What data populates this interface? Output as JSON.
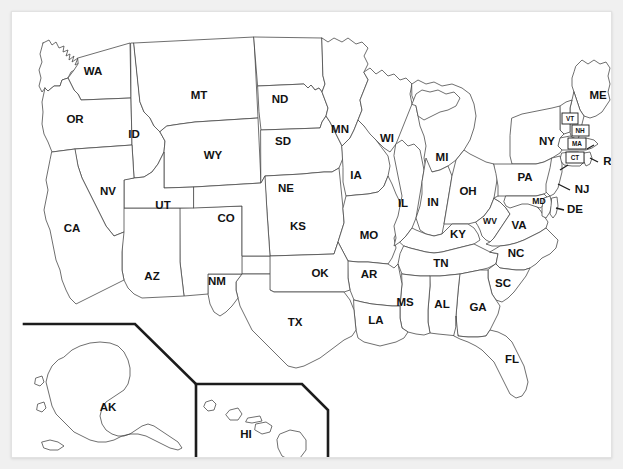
{
  "page": {
    "background_color": "#f0f0f0",
    "card_color": "#ffffff",
    "outline_color": "#4a4a4a",
    "label_color": "#121212",
    "inset_border_color": "#1c1c1c"
  },
  "map": {
    "type": "choropleth-outline",
    "region": "United States of America",
    "projection": "albers-usa",
    "state_count": 50,
    "labels_are_postal_abbreviations": true,
    "insets": [
      {
        "id": "alaska-inset",
        "label": "AK",
        "name": "Alaska"
      },
      {
        "id": "hawaii-inset",
        "label": "HI",
        "name": "Hawaii"
      }
    ]
  },
  "states": [
    {
      "abbr": "WA",
      "name": "Washington",
      "x": 81,
      "y": 60,
      "size": "lg"
    },
    {
      "abbr": "OR",
      "name": "Oregon",
      "x": 63,
      "y": 108,
      "size": "lg"
    },
    {
      "abbr": "ID",
      "name": "Idaho",
      "x": 122,
      "y": 123,
      "size": "lg"
    },
    {
      "abbr": "MT",
      "name": "Montana",
      "x": 187,
      "y": 84,
      "size": "lg"
    },
    {
      "abbr": "ND",
      "name": "North Dakota",
      "x": 268,
      "y": 88,
      "size": "lg"
    },
    {
      "abbr": "SD",
      "name": "South Dakota",
      "x": 271,
      "y": 130,
      "size": "lg"
    },
    {
      "abbr": "NE",
      "name": "Nebraska",
      "x": 274,
      "y": 177,
      "size": "lg"
    },
    {
      "abbr": "KS",
      "name": "Kansas",
      "x": 286,
      "y": 215,
      "size": "lg"
    },
    {
      "abbr": "MN",
      "name": "Minnesota",
      "x": 328,
      "y": 118,
      "size": "lg"
    },
    {
      "abbr": "IA",
      "name": "Iowa",
      "x": 344,
      "y": 164,
      "size": "lg"
    },
    {
      "abbr": "MO",
      "name": "Missouri",
      "x": 357,
      "y": 224,
      "size": "lg"
    },
    {
      "abbr": "WI",
      "name": "Wisconsin",
      "x": 375,
      "y": 127,
      "size": "lg"
    },
    {
      "abbr": "IL",
      "name": "Illinois",
      "x": 391,
      "y": 192,
      "size": "lg"
    },
    {
      "abbr": "MI",
      "name": "Michigan",
      "x": 430,
      "y": 146,
      "size": "lg"
    },
    {
      "abbr": "IN",
      "name": "Indiana",
      "x": 421,
      "y": 191,
      "size": "lg"
    },
    {
      "abbr": "OH",
      "name": "Ohio",
      "x": 456,
      "y": 180,
      "size": "lg"
    },
    {
      "abbr": "KY",
      "name": "Kentucky",
      "x": 446,
      "y": 223,
      "size": "lg"
    },
    {
      "abbr": "WV",
      "name": "West Virginia",
      "x": 478,
      "y": 210,
      "size": "md"
    },
    {
      "abbr": "VA",
      "name": "Virginia",
      "x": 507,
      "y": 214,
      "size": "lg"
    },
    {
      "abbr": "TN",
      "name": "Tennessee",
      "x": 429,
      "y": 252,
      "size": "lg"
    },
    {
      "abbr": "NC",
      "name": "North Carolina",
      "x": 504,
      "y": 242,
      "size": "lg"
    },
    {
      "abbr": "SC",
      "name": "South Carolina",
      "x": 491,
      "y": 272,
      "size": "lg"
    },
    {
      "abbr": "GA",
      "name": "Georgia",
      "x": 466,
      "y": 296,
      "size": "lg"
    },
    {
      "abbr": "AL",
      "name": "Alabama",
      "x": 430,
      "y": 293,
      "size": "lg"
    },
    {
      "abbr": "MS",
      "name": "Mississippi",
      "x": 393,
      "y": 291,
      "size": "lg"
    },
    {
      "abbr": "AR",
      "name": "Arkansas",
      "x": 357,
      "y": 263,
      "size": "lg"
    },
    {
      "abbr": "LA",
      "name": "Louisiana",
      "x": 364,
      "y": 309,
      "size": "lg"
    },
    {
      "abbr": "OK",
      "name": "Oklahoma",
      "x": 308,
      "y": 262,
      "size": "lg"
    },
    {
      "abbr": "TX",
      "name": "Texas",
      "x": 283,
      "y": 311,
      "size": "lg"
    },
    {
      "abbr": "NM",
      "name": "New Mexico",
      "x": 205,
      "y": 270,
      "size": "lg"
    },
    {
      "abbr": "AZ",
      "name": "Arizona",
      "x": 140,
      "y": 265,
      "size": "lg"
    },
    {
      "abbr": "UT",
      "name": "Utah",
      "x": 151,
      "y": 194,
      "size": "lg"
    },
    {
      "abbr": "CO",
      "name": "Colorado",
      "x": 214,
      "y": 207,
      "size": "lg"
    },
    {
      "abbr": "WY",
      "name": "Wyoming",
      "x": 201,
      "y": 144,
      "size": "lg"
    },
    {
      "abbr": "NV",
      "name": "Nevada",
      "x": 96,
      "y": 180,
      "size": "lg"
    },
    {
      "abbr": "CA",
      "name": "California",
      "x": 60,
      "y": 217,
      "size": "lg"
    },
    {
      "abbr": "FL",
      "name": "Florida",
      "x": 500,
      "y": 348,
      "size": "lg"
    },
    {
      "abbr": "ME",
      "name": "Maine",
      "x": 586,
      "y": 84,
      "size": "lg"
    },
    {
      "abbr": "NY",
      "name": "New York",
      "x": 535,
      "y": 130,
      "size": "lg"
    },
    {
      "abbr": "PA",
      "name": "Pennsylvania",
      "x": 513,
      "y": 166,
      "size": "lg"
    },
    {
      "abbr": "VT",
      "name": "Vermont",
      "x": 558,
      "y": 107,
      "size": "sm"
    },
    {
      "abbr": "NH",
      "name": "New Hampshire",
      "x": 568,
      "y": 119,
      "size": "sm"
    },
    {
      "abbr": "MA",
      "name": "Massachusetts",
      "x": 565,
      "y": 132,
      "size": "sm"
    },
    {
      "abbr": "CT",
      "name": "Connecticut",
      "x": 563,
      "y": 146,
      "size": "sm"
    },
    {
      "abbr": "RI",
      "name": "Rhode Island",
      "x": 597,
      "y": 150,
      "size": "lg"
    },
    {
      "abbr": "NJ",
      "name": "New Jersey",
      "x": 570,
      "y": 178,
      "size": "lg"
    },
    {
      "abbr": "DE",
      "name": "Delaware",
      "x": 563,
      "y": 198,
      "size": "lg"
    },
    {
      "abbr": "MD",
      "name": "Maryland",
      "x": 527,
      "y": 190,
      "size": "md"
    },
    {
      "abbr": "AK",
      "name": "Alaska",
      "x": 96,
      "y": 396,
      "size": "lg"
    },
    {
      "abbr": "HI",
      "name": "Hawaii",
      "x": 234,
      "y": 423,
      "size": "lg"
    }
  ]
}
